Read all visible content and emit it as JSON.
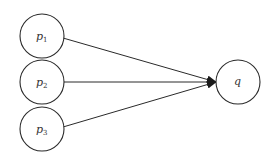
{
  "diagram": {
    "type": "directed-graph",
    "colors": {
      "stroke": "#2a2a2a",
      "text": "#333333",
      "background": "#ffffff"
    },
    "nodes": [
      {
        "id": "p1",
        "base": "p",
        "sub": "1",
        "cx": 42,
        "cy": 36,
        "r": 22
      },
      {
        "id": "p2",
        "base": "p",
        "sub": "2",
        "cx": 42,
        "cy": 82,
        "r": 22
      },
      {
        "id": "p3",
        "base": "p",
        "sub": "3",
        "cx": 42,
        "cy": 129,
        "r": 22
      },
      {
        "id": "q",
        "base": "q",
        "sub": "",
        "cx": 238,
        "cy": 82,
        "r": 22
      }
    ],
    "edges": [
      {
        "from": "p1",
        "to": "q"
      },
      {
        "from": "p2",
        "to": "q"
      },
      {
        "from": "p3",
        "to": "q"
      }
    ]
  }
}
